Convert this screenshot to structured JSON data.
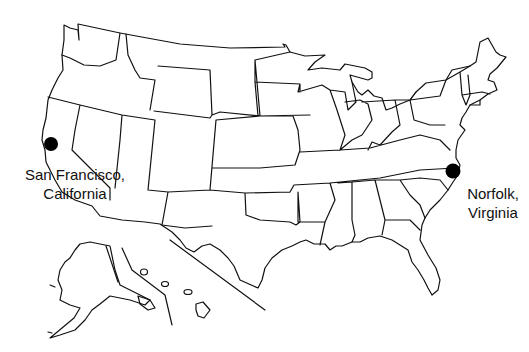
{
  "map": {
    "type": "outline map",
    "region": "United States",
    "insets": [
      "Alaska",
      "Hawaii"
    ],
    "stroke_color": "#111111",
    "background": "#ffffff"
  },
  "markers": [
    {
      "id": "san-francisco",
      "label_line1": "San Francisco,",
      "label_line2": "California",
      "x": 51,
      "y": 144,
      "color": "#000000"
    },
    {
      "id": "norfolk",
      "label_line1": "Norfolk,",
      "label_line2": "Virginia",
      "x": 453,
      "y": 171,
      "color": "#000000"
    }
  ]
}
